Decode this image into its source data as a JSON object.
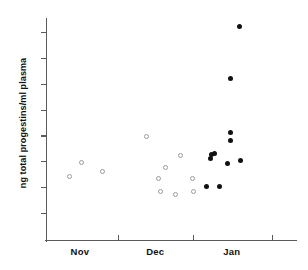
{
  "figure": {
    "background_color": "#ffffff",
    "axis_color": "#5a5a5a",
    "open_marker_color": "#9a9a9a",
    "filled_marker_color": "#111111"
  },
  "chart_data": {
    "type": "scatter",
    "title": "",
    "subtitle": "",
    "xlabel": "",
    "ylabel": "ng total progestins/ml plasma",
    "ylim": [
      0,
      8.75
    ],
    "yticks": [
      1,
      2,
      3,
      4,
      5,
      6,
      7,
      8
    ],
    "ytick_labels": [
      "1",
      "2",
      "3",
      "4",
      "5",
      "6",
      "7",
      "8"
    ],
    "xlim": [
      0,
      100
    ],
    "xtick_positions": [
      28.5,
      58.5,
      90
    ],
    "xtick_labels": [
      "",
      "",
      ""
    ],
    "x_category_labels": [
      "Nov",
      "Dec",
      "Jan"
    ],
    "x_category_positions": [
      13.5,
      43.5,
      74
    ],
    "grid": false,
    "legend": null,
    "series": [
      {
        "name": "open circles",
        "marker": "open-circle",
        "color": "#9a9a9a",
        "points": [
          {
            "x": 9.5,
            "y": 2.4
          },
          {
            "x": 14.0,
            "y": 2.95
          },
          {
            "x": 22.5,
            "y": 2.6
          },
          {
            "x": 40.0,
            "y": 3.95
          },
          {
            "x": 45.0,
            "y": 2.35
          },
          {
            "x": 45.6,
            "y": 1.85
          },
          {
            "x": 47.5,
            "y": 2.75
          },
          {
            "x": 51.5,
            "y": 1.7
          },
          {
            "x": 53.5,
            "y": 3.22
          },
          {
            "x": 58.5,
            "y": 2.35
          },
          {
            "x": 58.8,
            "y": 1.82
          }
        ]
      },
      {
        "name": "filled circles",
        "marker": "filled-circle",
        "color": "#111111",
        "points": [
          {
            "x": 64.0,
            "y": 2.02
          },
          {
            "x": 69.0,
            "y": 2.02
          },
          {
            "x": 65.6,
            "y": 3.12
          },
          {
            "x": 65.8,
            "y": 3.26
          },
          {
            "x": 67.2,
            "y": 3.32
          },
          {
            "x": 73.5,
            "y": 4.12
          },
          {
            "x": 73.6,
            "y": 3.82
          },
          {
            "x": 73.4,
            "y": 6.22
          },
          {
            "x": 72.2,
            "y": 2.93
          },
          {
            "x": 77.5,
            "y": 3.02
          },
          {
            "x": 77.0,
            "y": 8.22
          }
        ]
      }
    ]
  }
}
